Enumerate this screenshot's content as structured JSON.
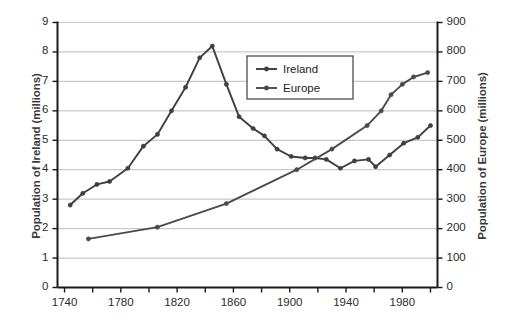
{
  "chart_data": {
    "type": "line",
    "title": "",
    "xlabel": "",
    "ylabel": "Population of Ireland (millions)",
    "y2label": "Population of Europe (millions)",
    "xlim": [
      1735,
      2005
    ],
    "ylim": [
      0,
      9
    ],
    "y2lim": [
      0,
      900
    ],
    "grid": true,
    "legend_position": "inside-top-center",
    "x_ticks": [
      1740,
      1780,
      1820,
      1860,
      1900,
      1940,
      1980
    ],
    "x_minor_ticks": [
      1760,
      1800,
      1840,
      1880,
      1920,
      1960,
      2000
    ],
    "y_ticks": [
      0,
      1,
      2,
      3,
      4,
      5,
      6,
      7,
      8,
      9
    ],
    "y2_ticks": [
      0,
      100,
      200,
      300,
      400,
      500,
      600,
      700,
      800,
      900
    ],
    "series": [
      {
        "name": "Ireland",
        "axis": "left",
        "color": "#3f3f3f",
        "unit": "millions",
        "points": [
          {
            "x": 1744,
            "y": 2.8
          },
          {
            "x": 1753,
            "y": 3.2
          },
          {
            "x": 1763,
            "y": 3.5
          },
          {
            "x": 1772,
            "y": 3.6
          },
          {
            "x": 1785,
            "y": 4.05
          },
          {
            "x": 1796,
            "y": 4.8
          },
          {
            "x": 1806,
            "y": 5.2
          },
          {
            "x": 1816,
            "y": 6.0
          },
          {
            "x": 1826,
            "y": 6.8
          },
          {
            "x": 1836,
            "y": 7.8
          },
          {
            "x": 1845,
            "y": 8.2
          },
          {
            "x": 1855,
            "y": 6.9
          },
          {
            "x": 1864,
            "y": 5.8
          },
          {
            "x": 1874,
            "y": 5.4
          },
          {
            "x": 1882,
            "y": 5.15
          },
          {
            "x": 1891,
            "y": 4.7
          },
          {
            "x": 1901,
            "y": 4.45
          },
          {
            "x": 1911,
            "y": 4.4
          },
          {
            "x": 1918,
            "y": 4.4
          },
          {
            "x": 1926,
            "y": 4.35
          },
          {
            "x": 1936,
            "y": 4.05
          },
          {
            "x": 1946,
            "y": 4.3
          },
          {
            "x": 1956,
            "y": 4.35
          },
          {
            "x": 1961,
            "y": 4.1
          },
          {
            "x": 1971,
            "y": 4.5
          },
          {
            "x": 1981,
            "y": 4.9
          },
          {
            "x": 1991,
            "y": 5.1
          },
          {
            "x": 2000,
            "y": 5.5
          }
        ]
      },
      {
        "name": "Europe",
        "axis": "right",
        "color": "#4a4a4a",
        "unit": "millions",
        "points": [
          {
            "x": 1757,
            "y": 165
          },
          {
            "x": 1806,
            "y": 205
          },
          {
            "x": 1855,
            "y": 285
          },
          {
            "x": 1905,
            "y": 400
          },
          {
            "x": 1930,
            "y": 470
          },
          {
            "x": 1955,
            "y": 550
          },
          {
            "x": 1965,
            "y": 600
          },
          {
            "x": 1972,
            "y": 655
          },
          {
            "x": 1980,
            "y": 690
          },
          {
            "x": 1988,
            "y": 715
          },
          {
            "x": 1998,
            "y": 730
          }
        ]
      }
    ]
  },
  "legend": {
    "entries": [
      {
        "label": "Ireland"
      },
      {
        "label": "Europe"
      }
    ]
  },
  "axes": {
    "left_title": "Population of Ireland (millions)",
    "right_title": "Population of Europe (millions)",
    "left_ticks": [
      "9",
      "8",
      "7",
      "6",
      "5",
      "4",
      "3",
      "2",
      "1",
      "0"
    ],
    "right_ticks": [
      "900",
      "800",
      "700",
      "600",
      "500",
      "400",
      "300",
      "200",
      "100",
      "0"
    ],
    "bottom_ticks": [
      "1740",
      "1780",
      "1820",
      "1860",
      "1900",
      "1940",
      "1980"
    ]
  },
  "colors": {
    "series_ireland": "#3f3f3f",
    "series_europe": "#4a4a4a",
    "grid": "#c9c9c9",
    "axis": "#1a1a1a",
    "text": "#2b2b2b",
    "background": "#ffffff"
  }
}
